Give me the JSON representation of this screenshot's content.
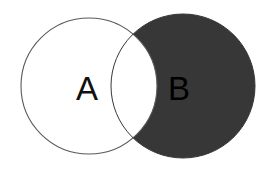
{
  "figure": {
    "type": "venn-diagram",
    "title": "",
    "background_color": "#ffffff",
    "width": 277,
    "height": 178
  },
  "sets": {
    "a": {
      "label": "A",
      "fill_color": "#ffffff",
      "stroke_color": "#5a5a5a",
      "label_color": "#111111",
      "center_x": 89,
      "center_y": 86,
      "radius": 68,
      "label_x": 87,
      "label_y": 88
    },
    "b": {
      "label": "B",
      "fill_color": "#373737",
      "stroke_color": "#373737",
      "label_color": "#000000",
      "center_x": 183,
      "center_y": 86,
      "radius": 72,
      "label_x": 179,
      "label_y": 88
    }
  },
  "intersection": {
    "label": "",
    "fill_color": "#ffffff",
    "stroke_color": "#5a5a5a",
    "description": "A intersect B shown unshaded"
  },
  "shading": {
    "shaded_region": "B minus A",
    "shaded_color": "#373737",
    "unshaded_color": "#ffffff"
  }
}
